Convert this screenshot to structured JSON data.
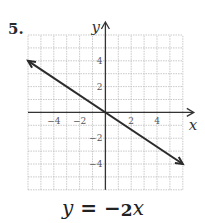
{
  "problem_number": "5.",
  "equation": {
    "lhs": "y",
    "equals": "=",
    "sign": "−",
    "numerator": "2",
    "rhs_var": "x"
  },
  "axis_labels": {
    "x": "x",
    "y": "y"
  },
  "chart_data": {
    "type": "line",
    "title": "",
    "xlabel": "x",
    "ylabel": "y",
    "xlim": [
      -6,
      6
    ],
    "ylim": [
      -6,
      6
    ],
    "grid": true,
    "x_tick_labels": [
      "−4",
      "−2",
      "2",
      "4"
    ],
    "x_ticks": [
      -4,
      -2,
      2,
      4
    ],
    "y_tick_labels": [
      "4",
      "2",
      "−2",
      "−4"
    ],
    "y_ticks": [
      4,
      2,
      -2,
      -4
    ],
    "series": [
      {
        "name": "y = −2/3 x",
        "x": [
          -6,
          0,
          6
        ],
        "y": [
          4,
          0,
          -4
        ],
        "arrows": "both"
      }
    ],
    "annotations": [
      "5."
    ],
    "legend": "none"
  },
  "colors": {
    "grid": "#bbbbbb",
    "axis": "#333333",
    "line": "#2b2b2b"
  }
}
